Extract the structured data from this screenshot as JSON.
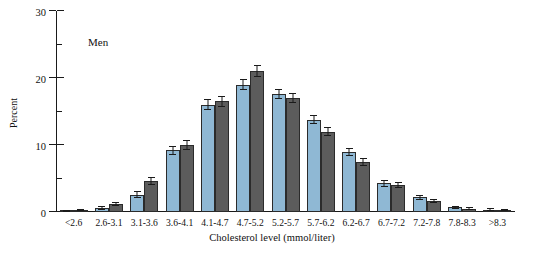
{
  "chart_data": {
    "type": "bar",
    "title": "",
    "annotation": "Men",
    "xlabel": "Cholesterol level (mmol/liter)",
    "ylabel": "Percent",
    "ylim": [
      0,
      30
    ],
    "yticks": [
      0,
      10,
      20,
      30
    ],
    "ytick_labels": [
      "0",
      "10",
      "20",
      "30"
    ],
    "yminor_ticks": [
      5,
      15,
      25
    ],
    "grid": false,
    "legend": "none",
    "categories": [
      "<2.6",
      "2.6-3.1",
      "3.1-3.6",
      "3.6-4.1",
      "4.1-4.7",
      "4.7-5.2",
      "5.2-5.7",
      "5.7-6.2",
      "6.2-6.7",
      "6.7-7.2",
      "7.2-7.8",
      "7.8-8.3",
      ">8.3"
    ],
    "series": [
      {
        "name": "series-light-blue",
        "color": "#8fb8d4",
        "values": [
          0.2,
          0.6,
          2.6,
          9.2,
          16.0,
          19.0,
          17.6,
          13.8,
          9.0,
          4.3,
          2.2,
          0.7,
          0.35
        ],
        "errors": [
          0.15,
          0.3,
          0.5,
          0.7,
          0.8,
          0.8,
          0.7,
          0.7,
          0.6,
          0.5,
          0.35,
          0.25,
          0.2
        ]
      },
      {
        "name": "series-dark-gray",
        "color": "#5c5c5c",
        "values": [
          0.25,
          1.2,
          4.6,
          10.0,
          16.5,
          21.0,
          17.0,
          12.0,
          7.5,
          4.0,
          1.7,
          0.5,
          0.3
        ],
        "errors": [
          0.15,
          0.35,
          0.6,
          0.7,
          0.8,
          0.9,
          0.8,
          0.7,
          0.6,
          0.45,
          0.3,
          0.2,
          0.2
        ]
      }
    ]
  }
}
